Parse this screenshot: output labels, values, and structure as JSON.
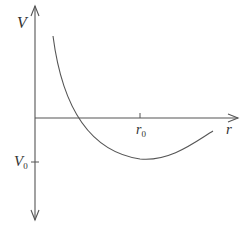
{
  "diagram": {
    "type": "potential-energy-curve",
    "labels": {
      "y_axis": "V",
      "x_axis": "r",
      "x_tick": "r",
      "x_tick_sub": "0",
      "y_tick": "V",
      "y_tick_sub": "0"
    },
    "colors": {
      "axis": "#555555",
      "curve": "#555555",
      "text": "#333333",
      "background": "#ffffff"
    }
  }
}
